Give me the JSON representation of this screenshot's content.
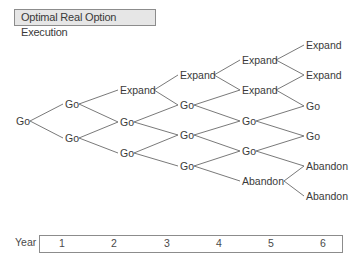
{
  "title": "Optimal Real Option Execution",
  "axis": {
    "label": "Year",
    "years": [
      "1",
      "2",
      "3",
      "4",
      "5",
      "6"
    ]
  },
  "tree": {
    "columns": [
      {
        "nodes": [
          {
            "label": "Go",
            "x": 16,
            "y": 121
          }
        ]
      },
      {
        "nodes": [
          {
            "label": "Go",
            "x": 65,
            "y": 104
          },
          {
            "label": "Go",
            "x": 65,
            "y": 138
          }
        ]
      },
      {
        "nodes": [
          {
            "label": "Expand",
            "x": 120,
            "y": 90
          },
          {
            "label": "Go",
            "x": 120,
            "y": 122
          },
          {
            "label": "Go",
            "x": 120,
            "y": 153
          }
        ]
      },
      {
        "nodes": [
          {
            "label": "Expand",
            "x": 180,
            "y": 75
          },
          {
            "label": "Go",
            "x": 180,
            "y": 105
          },
          {
            "label": "Go",
            "x": 180,
            "y": 135
          },
          {
            "label": "Go",
            "x": 180,
            "y": 166
          }
        ]
      },
      {
        "nodes": [
          {
            "label": "Expand",
            "x": 242,
            "y": 60
          },
          {
            "label": "Expand",
            "x": 242,
            "y": 90
          },
          {
            "label": "Go",
            "x": 242,
            "y": 121
          },
          {
            "label": "Go",
            "x": 242,
            "y": 151
          },
          {
            "label": "Abandon",
            "x": 242,
            "y": 181
          }
        ]
      },
      {
        "nodes": [
          {
            "label": "Expand",
            "x": 306,
            "y": 45
          },
          {
            "label": "Expand",
            "x": 306,
            "y": 75
          },
          {
            "label": "Go",
            "x": 306,
            "y": 106
          },
          {
            "label": "Go",
            "x": 306,
            "y": 136
          },
          {
            "label": "Abandon",
            "x": 306,
            "y": 166
          },
          {
            "label": "Abandon",
            "x": 306,
            "y": 196
          }
        ]
      }
    ]
  },
  "colors": {
    "text": "#3a3a3a",
    "line": "#6a6a6a",
    "title_bg": "#e6e6e6",
    "border": "#8c8c8c"
  }
}
